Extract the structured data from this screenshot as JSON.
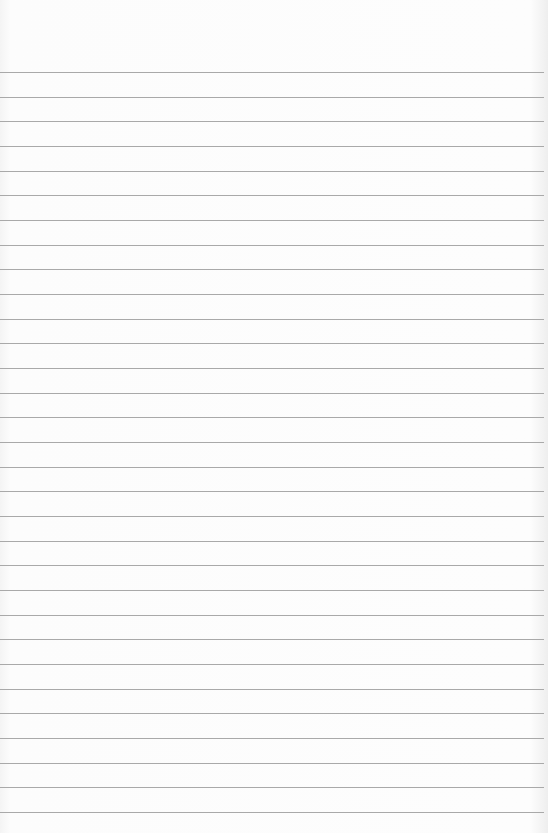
{
  "page": {
    "type": "ruled-paper",
    "background_color": "#fbfbfb",
    "line_color": "#a9a9a9",
    "first_line_y": 72,
    "line_spacing": 24.67,
    "line_count": 31
  }
}
